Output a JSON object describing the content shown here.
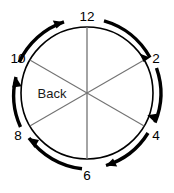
{
  "diagram": {
    "type": "clock-face-sector-diagram",
    "region_label": "Back",
    "colors": {
      "circle_outline": "#000000",
      "spoke": "#737373",
      "arrow": "#000000",
      "label_text": "#000000",
      "region_text": "#1a1a1a",
      "background": "#ffffff"
    },
    "geometry": {
      "center_x": 87,
      "center_y": 93,
      "circle_radius": 66,
      "arrow_radius": 76,
      "sector_count": 6
    },
    "clock_labels": [
      {
        "text": "12",
        "angle_deg": 90,
        "x": 87,
        "y": 21,
        "anchor": "middle"
      },
      {
        "text": "2",
        "angle_deg": 30,
        "x": 155,
        "y": 59,
        "anchor": "middle"
      },
      {
        "text": "4",
        "angle_deg": -30,
        "x": 155,
        "y": 137,
        "anchor": "middle"
      },
      {
        "text": "6",
        "angle_deg": -90,
        "x": 87,
        "y": 178,
        "anchor": "middle"
      },
      {
        "text": "8",
        "angle_deg": -150,
        "x": 20,
        "y": 137,
        "anchor": "middle"
      },
      {
        "text": "10",
        "angle_deg": 150,
        "x": 18,
        "y": 59,
        "anchor": "middle"
      }
    ],
    "spokes": [
      {
        "name": "spoke-12-6",
        "from_label": "12",
        "to_label": "6",
        "angle_deg": 90
      },
      {
        "name": "spoke-2-8",
        "from_label": "2",
        "to_label": "8",
        "angle_deg": 30
      },
      {
        "name": "spoke-4-10",
        "from_label": "4",
        "to_label": "10",
        "angle_deg": 330
      }
    ],
    "arrows": [
      {
        "name": "arrow-10-to-12",
        "from_label": "10",
        "to_label": "12",
        "direction": "clockwise"
      },
      {
        "name": "arrow-12-to-2",
        "from_label": "12",
        "to_label": "2",
        "direction": "clockwise"
      },
      {
        "name": "arrow-2-to-4",
        "from_label": "2",
        "to_label": "4",
        "direction": "clockwise"
      },
      {
        "name": "arrow-4-to-6",
        "from_label": "4",
        "to_label": "6",
        "direction": "clockwise"
      },
      {
        "name": "arrow-6-to-8",
        "from_label": "6",
        "to_label": "8",
        "direction": "clockwise"
      },
      {
        "name": "arrow-8-to-10",
        "from_label": "8",
        "to_label": "10",
        "direction": "clockwise"
      }
    ]
  }
}
